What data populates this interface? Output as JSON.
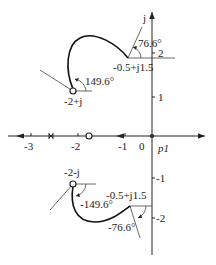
{
  "diagram": {
    "type": "root-locus-angle-of-departure",
    "axes": {
      "real_axis_label": "p1",
      "imag_axis_label": "j",
      "real_ticks": [
        "-3",
        "-2",
        "-1",
        "0"
      ],
      "imag_ticks": [
        "2",
        "1",
        "-1",
        "-2"
      ]
    },
    "upper_branch": {
      "start_label": "-2+j",
      "start_angle_label": "149.6°",
      "end_label": "-0.5+j1.5",
      "end_angle_label": "76.6°"
    },
    "lower_branch": {
      "start_label": "-2-j",
      "start_angle_label": "-149.6°",
      "end_label": "-0.5+j1.5",
      "end_angle_label": "-76.6°"
    },
    "markers": {
      "pole_cross": "×",
      "zero_circle": "o",
      "origin_dot": "•"
    }
  }
}
